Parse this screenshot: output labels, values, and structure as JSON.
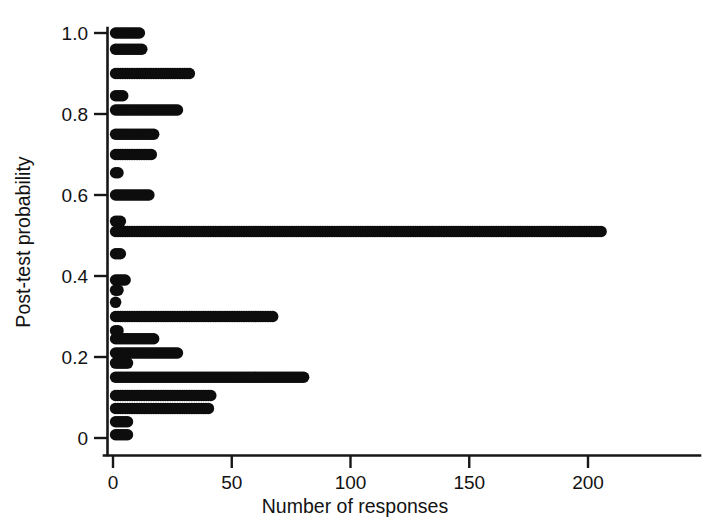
{
  "figure": {
    "background_color": "#ffffff",
    "marker_color": "#0d0d0d",
    "axis_color": "#171717"
  },
  "axes": {
    "x_title": "Number of responses",
    "y_title": "Post-test probability",
    "x_ticks": [
      "0",
      "50",
      "100",
      "150",
      "200"
    ],
    "x_tick_values": [
      0,
      50,
      100,
      150,
      200
    ],
    "y_ticks": [
      "0",
      "0.2",
      "0.4",
      "0.6",
      "0.8",
      "1.0"
    ],
    "y_tick_values": [
      0,
      0.2,
      0.4,
      0.6,
      0.8,
      1.0
    ]
  },
  "chart_data": {
    "type": "scatter",
    "title": "",
    "subtitle": "",
    "xlabel": "Number of responses",
    "ylabel": "Post-test probability",
    "xlim": [
      0,
      212
    ],
    "ylim": [
      -0.02,
      1.03
    ],
    "grid": false,
    "legend": false,
    "marker_style": "filled-circle-stacked-row",
    "categories": [
      1.0,
      0.96,
      0.9,
      0.845,
      0.81,
      0.75,
      0.7,
      0.655,
      0.6,
      0.535,
      0.51,
      0.455,
      0.39,
      0.365,
      0.335,
      0.3,
      0.265,
      0.245,
      0.21,
      0.185,
      0.15,
      0.105,
      0.073,
      0.04,
      0.008
    ],
    "values": [
      11,
      12,
      32,
      4,
      27,
      17,
      16,
      2,
      15,
      3,
      205,
      3,
      5,
      2,
      1,
      67,
      2,
      17,
      27,
      6,
      80,
      41,
      40,
      6,
      6
    ],
    "points": [
      {
        "y": 1.0,
        "count": 11
      },
      {
        "y": 0.96,
        "count": 12
      },
      {
        "y": 0.9,
        "count": 32
      },
      {
        "y": 0.845,
        "count": 4
      },
      {
        "y": 0.81,
        "count": 27
      },
      {
        "y": 0.75,
        "count": 17
      },
      {
        "y": 0.7,
        "count": 16
      },
      {
        "y": 0.655,
        "count": 2
      },
      {
        "y": 0.6,
        "count": 15
      },
      {
        "y": 0.535,
        "count": 3
      },
      {
        "y": 0.51,
        "count": 205
      },
      {
        "y": 0.455,
        "count": 3
      },
      {
        "y": 0.39,
        "count": 5
      },
      {
        "y": 0.365,
        "count": 2
      },
      {
        "y": 0.335,
        "count": 1
      },
      {
        "y": 0.3,
        "count": 67
      },
      {
        "y": 0.265,
        "count": 2
      },
      {
        "y": 0.245,
        "count": 17
      },
      {
        "y": 0.21,
        "count": 27
      },
      {
        "y": 0.185,
        "count": 6
      },
      {
        "y": 0.15,
        "count": 80
      },
      {
        "y": 0.105,
        "count": 41
      },
      {
        "y": 0.073,
        "count": 40
      },
      {
        "y": 0.04,
        "count": 6
      },
      {
        "y": 0.008,
        "count": 6
      }
    ]
  },
  "geometry": {
    "x_origin_px": 113,
    "x_scale_px_per_unit": 2.375,
    "y_origin_px": 438,
    "y_scale_px_per_unit": 405,
    "dot_diameter_px": 11.5,
    "dot_step_px": 2.38
  }
}
